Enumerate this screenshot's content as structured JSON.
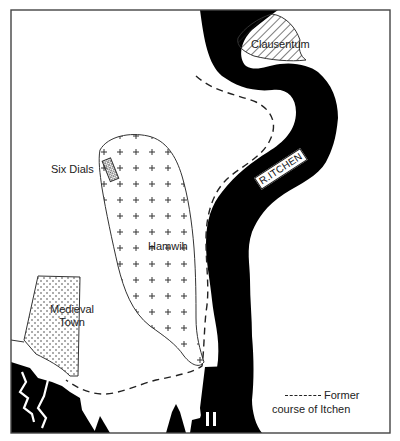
{
  "map": {
    "colors": {
      "water": "#000000",
      "land": "#ffffff",
      "outline": "#333333",
      "label_text": "#222222"
    },
    "areas": [
      {
        "id": "clausentum",
        "label": "Clausentum",
        "pattern": "diagonal-hatch"
      },
      {
        "id": "hamwih",
        "label": "Hamwih",
        "pattern": "plus-signs"
      },
      {
        "id": "six-dials",
        "label": "Six Dials",
        "pattern": "cross-hatch"
      },
      {
        "id": "medieval-town",
        "label_line1": "Medieval",
        "label_line2": "Town",
        "pattern": "dots"
      }
    ],
    "river": {
      "label": "R.ITCHEN"
    },
    "legend": {
      "symbol": "dashed-line",
      "line1": "Former",
      "line2": "course of Itchen"
    }
  }
}
